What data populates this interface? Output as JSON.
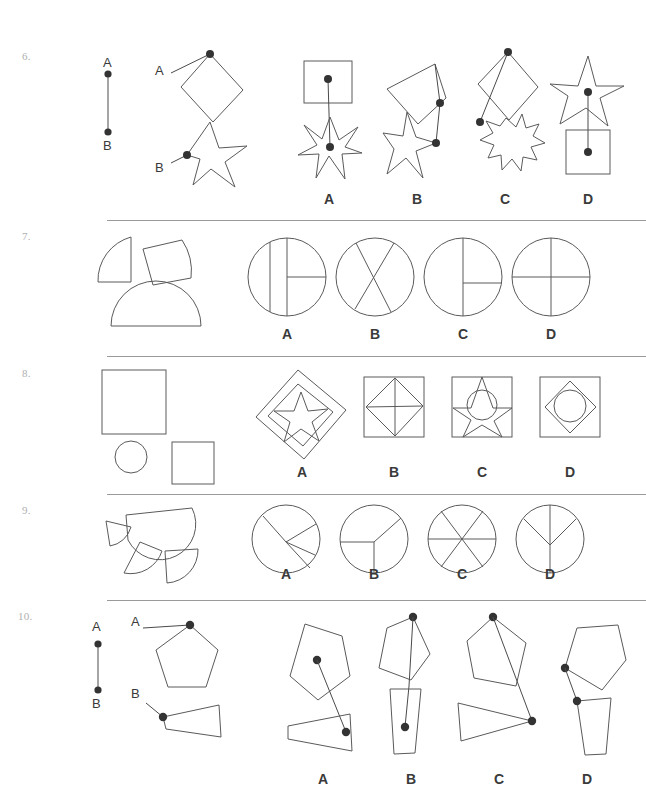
{
  "page": {
    "width": 646,
    "height": 799,
    "background": "#ffffff",
    "stroke_color": "#5a5a5a",
    "dot_color": "#333333",
    "separator_color": "#9a9a9a",
    "number_color": "#b0b0b0",
    "letter_color": "#3a3a3a"
  },
  "option_letters": [
    "A",
    "B",
    "C",
    "D"
  ],
  "reference_labels": {
    "a": "A",
    "b": "B"
  },
  "questions": [
    {
      "number": "6.",
      "number_x": 22,
      "number_y": 56,
      "separator": null,
      "type": "point-connection",
      "prompt_kind": "diamond-and-star-with-marked-points",
      "reference_line": {
        "label_a": "A",
        "label_b": "B",
        "x": 108,
        "y_top": 73,
        "y_bottom": 131
      },
      "options": [
        {
          "letter": "A",
          "letter_x": 329,
          "letter_y": 198,
          "shapes": [
            "square",
            "six-point-star"
          ],
          "dots": [
            "square-center",
            "star-center"
          ]
        },
        {
          "letter": "B",
          "letter_x": 417,
          "letter_y": 198,
          "shapes": [
            "diamond",
            "five-point-star"
          ],
          "dots": [
            "diamond-right-vertex",
            "star-right-edge"
          ]
        },
        {
          "letter": "C",
          "letter_x": 505,
          "letter_y": 198,
          "shapes": [
            "diamond",
            "eight-point-star"
          ],
          "dots": [
            "diamond-top-vertex",
            "star-left-edge"
          ]
        },
        {
          "letter": "D",
          "letter_x": 588,
          "letter_y": 198,
          "shapes": [
            "five-point-star",
            "square"
          ],
          "dots": [
            "star-center",
            "square-center"
          ]
        }
      ]
    },
    {
      "number": "7.",
      "number_x": 22,
      "number_y": 236,
      "separator": {
        "y": 220
      },
      "type": "assemble-circle",
      "prompt_kind": "quarter-sector-quarter-and-half-disc",
      "pieces": [
        "quarter-circle",
        "tilted-quarter-sector",
        "half-disc"
      ],
      "options": [
        {
          "letter": "A",
          "letter_x": 276,
          "letter_y": 334,
          "pattern": "vertical-diameter-plus-offset-vertical-chord-plus-right-radius"
        },
        {
          "letter": "B",
          "letter_x": 364,
          "letter_y": 334,
          "pattern": "two-crossing-chords-x-shape"
        },
        {
          "letter": "C",
          "letter_x": 452,
          "letter_y": 334,
          "pattern": "vertical-diameter-plus-right-radius"
        },
        {
          "letter": "D",
          "letter_x": 540,
          "letter_y": 334,
          "pattern": "vertical-and-horizontal-diameters-quarters"
        }
      ]
    },
    {
      "number": "8.",
      "number_x": 22,
      "number_y": 373,
      "separator": {
        "y": 356
      },
      "type": "assemble-composite",
      "prompt_kind": "large-square-small-square-and-circle",
      "pieces": [
        "large-square",
        "circle",
        "small-square"
      ],
      "options": [
        {
          "letter": "A",
          "letter_x": 301,
          "letter_y": 472,
          "contents": [
            "rotated-square-outer",
            "rotated-square-inner",
            "five-point-star"
          ]
        },
        {
          "letter": "B",
          "letter_x": 393,
          "letter_y": 472,
          "contents": [
            "square",
            "inscribed-diamond",
            "diagonals"
          ]
        },
        {
          "letter": "C",
          "letter_x": 481,
          "letter_y": 472,
          "contents": [
            "square",
            "five-point-star",
            "circle"
          ]
        },
        {
          "letter": "D",
          "letter_x": 569,
          "letter_y": 472,
          "contents": [
            "square",
            "inscribed-diamond",
            "circle"
          ]
        }
      ]
    },
    {
      "number": "9.",
      "number_x": 22,
      "number_y": 510,
      "separator": {
        "y": 494
      },
      "type": "assemble-circle",
      "prompt_kind": "half-disc-and-three-sectors",
      "pieces": [
        "half-disc",
        "small-sector",
        "quarter-sector",
        "quarter-sector-2"
      ],
      "options": [
        {
          "letter": "A",
          "letter_x": 276,
          "letter_y": 574,
          "pattern": "four-unequal-sectors"
        },
        {
          "letter": "B",
          "letter_x": 364,
          "letter_y": 574,
          "pattern": "three-sectors-y-shape"
        },
        {
          "letter": "C",
          "letter_x": 452,
          "letter_y": 574,
          "pattern": "six-equal-sectors"
        },
        {
          "letter": "D",
          "letter_x": 540,
          "letter_y": 574,
          "pattern": "half-plus-two-quarters"
        }
      ]
    },
    {
      "number": "10.",
      "number_x": 18,
      "number_y": 616,
      "separator": {
        "y": 600
      },
      "type": "point-connection",
      "prompt_kind": "pentagon-and-trapezoid-with-marked-points",
      "reference_line": {
        "label_a": "A",
        "label_b": "B",
        "x": 98,
        "y_top": 645,
        "y_bottom": 690
      },
      "options": [
        {
          "letter": "A",
          "letter_x": 313,
          "letter_y": 779,
          "shapes": [
            "pentagon",
            "trapezoid"
          ],
          "dots": [
            "pentagon-interior",
            "trapezoid-right-vertex"
          ]
        },
        {
          "letter": "B",
          "letter_x": 401,
          "letter_y": 779,
          "shapes": [
            "pentagon",
            "narrow-trapezoid"
          ],
          "dots": [
            "pentagon-top-vertex",
            "trapezoid-interior"
          ]
        },
        {
          "letter": "C",
          "letter_x": 489,
          "letter_y": 779,
          "shapes": [
            "pentagon",
            "trapezoid"
          ],
          "dots": [
            "pentagon-top-vertex",
            "trapezoid-right-vertex"
          ]
        },
        {
          "letter": "D",
          "letter_x": 577,
          "letter_y": 779,
          "shapes": [
            "pentagon",
            "narrow-trapezoid"
          ],
          "dots": [
            "pentagon-left-vertex",
            "trapezoid-top-left"
          ]
        }
      ]
    }
  ]
}
